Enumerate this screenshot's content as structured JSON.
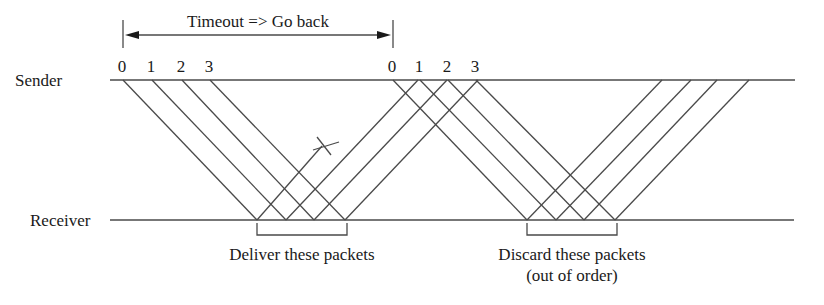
{
  "diagram": {
    "timeout_label": "Timeout => Go back",
    "sender_label": "Sender",
    "receiver_label": "Receiver",
    "deliver_label": "Deliver these packets",
    "discard_label_line1": "Discard these packets",
    "discard_label_line2": "(out of order)",
    "packet_numbers_first": [
      "0",
      "1",
      "2",
      "3"
    ],
    "packet_numbers_second": [
      "0",
      "1",
      "2",
      "3"
    ],
    "line_color": "#4a4a4a",
    "text_color": "#1a1a1a"
  },
  "geometry": {
    "sender_y": 80,
    "receiver_y": 220,
    "sender_line": [
      110,
      795
    ],
    "receiver_line": [
      110,
      794
    ],
    "timeout_arrow": {
      "x1": 123,
      "x2": 393,
      "y": 35,
      "tick_top": 20,
      "tick_bottom": 48
    },
    "first_batch": {
      "depart_x": [
        123,
        152,
        182,
        210
      ],
      "arrive_x": [
        257,
        286,
        314,
        345
      ]
    },
    "first_acks": {
      "from_x": [
        286,
        314,
        345
      ],
      "to_x": [
        418,
        447,
        478
      ],
      "lost_ack": {
        "from_x": 257,
        "to": [
          322,
          146
        ]
      }
    },
    "second_batch": {
      "depart_x": [
        393,
        420,
        448,
        476
      ],
      "arrive_x": [
        527,
        556,
        584,
        615
      ]
    },
    "second_acks": {
      "from_x": [
        527,
        556,
        584,
        615
      ],
      "to_x": [
        662,
        691,
        717,
        749
      ]
    },
    "deliver_bracket": [
      257,
      347,
      235
    ],
    "discard_bracket": [
      527,
      617,
      235
    ]
  }
}
